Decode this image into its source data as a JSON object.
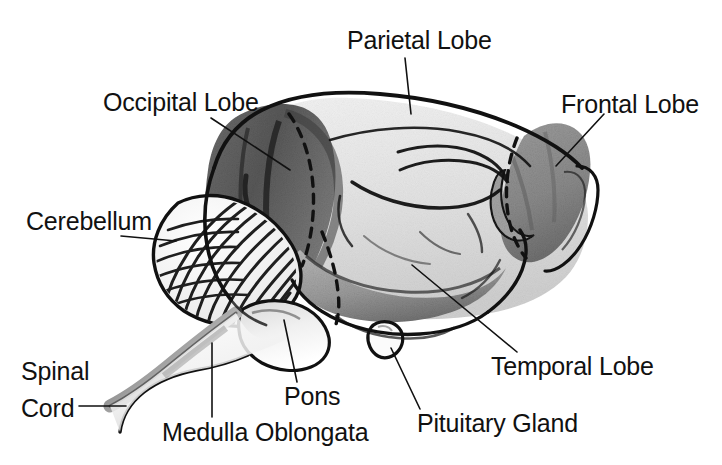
{
  "figure": {
    "background_color": "#ffffff",
    "ink_color": "#111111",
    "width": 722,
    "height": 465
  },
  "labels": {
    "parietal_lobe": "Parietal Lobe",
    "occipital_lobe": "Occipital Lobe",
    "frontal_lobe": "Frontal Lobe",
    "cerebellum": "Cerebellum",
    "spinal_cord_line1": "Spinal",
    "spinal_cord_line2": "Cord",
    "medulla_oblongata": "Medulla Oblongata",
    "pons": "Pons",
    "pituitary_gland": "Pituitary Gland",
    "temporal_lobe": "Temporal Lobe"
  },
  "label_positions": {
    "parietal_lobe": {
      "left": 347,
      "top": 27
    },
    "occipital_lobe": {
      "left": 103,
      "top": 89
    },
    "frontal_lobe": {
      "left": 561,
      "top": 91
    },
    "cerebellum": {
      "left": 26,
      "top": 208
    },
    "spinal_cord": {
      "left": 21,
      "top": 358
    },
    "medulla_oblongata": {
      "left": 162,
      "top": 419
    },
    "pons": {
      "left": 284,
      "top": 383
    },
    "pituitary_gland": {
      "left": 417,
      "top": 410
    },
    "temporal_lobe": {
      "left": 491,
      "top": 353
    }
  },
  "leader_lines": [
    {
      "name": "parietal-lobe-leader",
      "points": "405,58 411,114"
    },
    {
      "name": "occipital-lobe-leader",
      "points": "211,118 290,170"
    },
    {
      "name": "frontal-lobe-leader",
      "points": "604,114 556,166"
    },
    {
      "name": "cerebellum-leader",
      "points": "121,236 176,241"
    },
    {
      "name": "spinal-cord-leader",
      "points": "79,406 126,406"
    },
    {
      "name": "medulla-oblongata-leader",
      "points": "212,417 212,343"
    },
    {
      "name": "pons-leader",
      "points": "297,382 284,320"
    },
    {
      "name": "pituitary-gland-leader",
      "points": "420,409 391,348"
    },
    {
      "name": "temporal-lobe-leader",
      "points": "517,352 412,265"
    }
  ],
  "structures": [
    {
      "name": "cerebrum",
      "shading": "light"
    },
    {
      "name": "occipital-lobe-region",
      "shading": "dark"
    },
    {
      "name": "frontal-lobe-region",
      "shading": "medium"
    },
    {
      "name": "temporal-lobe-region",
      "shading": "medium"
    },
    {
      "name": "cerebellum-region",
      "shading": "striated"
    },
    {
      "name": "pons-region",
      "shading": "light"
    },
    {
      "name": "medulla-oblongata-region",
      "shading": "light"
    },
    {
      "name": "spinal-cord-region",
      "shading": "gradient"
    },
    {
      "name": "pituitary-gland-region",
      "shading": "light"
    }
  ]
}
